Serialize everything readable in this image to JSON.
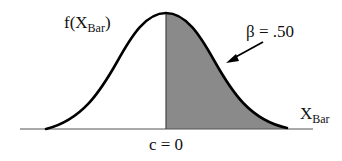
{
  "diagram": {
    "type": "normal-distribution-curve",
    "y_label": {
      "main": "f(X",
      "sub": "Bar",
      "close": ")"
    },
    "x_label": {
      "main": "X",
      "sub": "Bar"
    },
    "critical_value_label": "c = 0",
    "shaded_area_label": "β = .50",
    "colors": {
      "curve": "#000000",
      "shade": "#8a8a8a",
      "axis": "#555555",
      "background": "#ffffff"
    }
  }
}
